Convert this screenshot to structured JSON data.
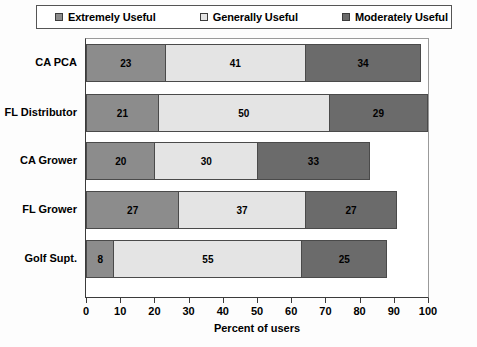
{
  "chart_data": {
    "type": "bar",
    "orientation": "horizontal",
    "stacked": true,
    "title": "",
    "xlabel": "Percent of users",
    "ylabel": "",
    "xlim": [
      0,
      100
    ],
    "xticks": [
      0,
      10,
      20,
      30,
      40,
      50,
      60,
      70,
      80,
      90,
      100
    ],
    "grid": false,
    "legend_position": "top",
    "categories": [
      "CA PCA",
      "FL Distributor",
      "CA Grower",
      "FL Grower",
      "Golf Supt."
    ],
    "series": [
      {
        "name": "Extremely Useful",
        "color": "#8c8c8c",
        "values": [
          23,
          21,
          20,
          27,
          8
        ]
      },
      {
        "name": "Generally Useful",
        "color": "#e4e4e4",
        "values": [
          41,
          50,
          30,
          37,
          55
        ]
      },
      {
        "name": "Moderately Useful",
        "color": "#6b6b6b",
        "values": [
          34,
          29,
          33,
          27,
          25
        ]
      }
    ],
    "totals": [
      98,
      100,
      83,
      91,
      88
    ]
  },
  "legend": {
    "items": [
      {
        "label": "Extremely Useful",
        "swatch": "#8c8c8c"
      },
      {
        "label": "Generally Useful",
        "swatch": "#e4e4e4"
      },
      {
        "label": "Moderately Useful",
        "swatch": "#6b6b6b"
      }
    ]
  },
  "axis": {
    "x_title": "Percent of users",
    "x_tick_labels": [
      "0",
      "10",
      "20",
      "30",
      "40",
      "50",
      "60",
      "70",
      "80",
      "90",
      "100"
    ]
  },
  "categories": [
    "CA PCA",
    "FL Distributor",
    "CA Grower",
    "FL Grower",
    "Golf Supt."
  ],
  "bars": [
    {
      "category": "CA PCA",
      "segments": [
        {
          "value": 23,
          "label": "23"
        },
        {
          "value": 41,
          "label": "41"
        },
        {
          "value": 34,
          "label": "34"
        }
      ]
    },
    {
      "category": "FL Distributor",
      "segments": [
        {
          "value": 21,
          "label": "21"
        },
        {
          "value": 50,
          "label": "50"
        },
        {
          "value": 29,
          "label": "29"
        }
      ]
    },
    {
      "category": "CA Grower",
      "segments": [
        {
          "value": 20,
          "label": "20"
        },
        {
          "value": 30,
          "label": "30"
        },
        {
          "value": 33,
          "label": "33"
        }
      ]
    },
    {
      "category": "FL Grower",
      "segments": [
        {
          "value": 27,
          "label": "27"
        },
        {
          "value": 37,
          "label": "37"
        },
        {
          "value": 27,
          "label": "27"
        }
      ]
    },
    {
      "category": "Golf Supt.",
      "segments": [
        {
          "value": 8,
          "label": "8"
        },
        {
          "value": 55,
          "label": "55"
        },
        {
          "value": 25,
          "label": "25"
        }
      ]
    }
  ]
}
